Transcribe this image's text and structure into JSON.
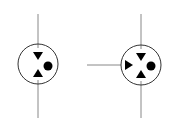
{
  "diagram": {
    "title": "",
    "stroke_color": "#888888",
    "symbol_color": "#000000",
    "background": "#ffffff",
    "symbols": [
      {
        "name": "three-port-connector",
        "center": [
          38,
          64
        ],
        "radius": 20,
        "ports": [
          "top",
          "bottom"
        ],
        "markers": [
          "triangle-down",
          "triangle-up",
          "dot"
        ]
      },
      {
        "name": "four-port-connector",
        "center": [
          141,
          65
        ],
        "radius": 20,
        "ports": [
          "top",
          "bottom",
          "left"
        ],
        "markers": [
          "triangle-down",
          "triangle-up",
          "triangle-right",
          "dot"
        ]
      }
    ]
  }
}
